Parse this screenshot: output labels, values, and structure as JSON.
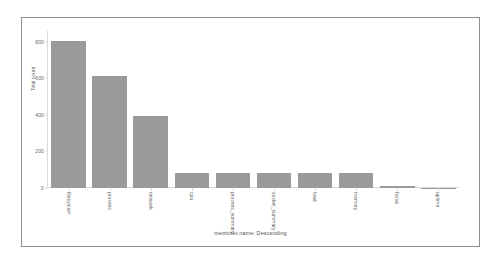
{
  "chart_data": {
    "type": "bar",
    "title": "",
    "xlabel": "metricset.name: Descending",
    "ylabel": "Total count",
    "categories": [
      "filesystem",
      "process",
      "network",
      "cpu",
      "process_summary",
      "socket_summary",
      "load",
      "memory",
      "fsstat",
      "uptime"
    ],
    "values": [
      805,
      612,
      397,
      81,
      81,
      81,
      81,
      81,
      10,
      1
    ],
    "ylim": [
      0,
      860
    ],
    "yticks": [
      0,
      200,
      400,
      600,
      800
    ],
    "ytick_labels": [
      "0",
      "200",
      "400",
      "600",
      "800"
    ],
    "grid": false,
    "legend": null,
    "bar_color": "#9a9a9a",
    "axis_color": "#d9d9d9",
    "text_color": "#666666",
    "panel_border_color": "#8c8c8c",
    "background": "#ffffff"
  }
}
